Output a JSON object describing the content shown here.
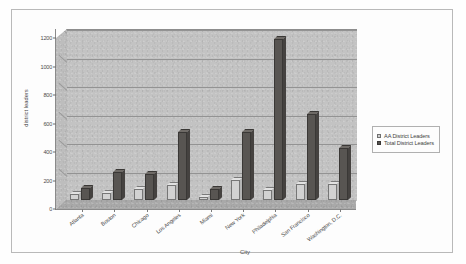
{
  "chart_data": {
    "type": "bar",
    "title": "",
    "xlabel": "City",
    "ylabel": "district leaders",
    "ylim": [
      0,
      1200
    ],
    "yticks": [
      0,
      200,
      400,
      600,
      800,
      1000,
      1200
    ],
    "grid": true,
    "legend_position": "right",
    "categories": [
      "Atlanta",
      "Boston",
      "Chicago",
      "Los Angeles",
      "Miami",
      "New York",
      "Philadelphia",
      "San Francisco",
      "Washington, D.C."
    ],
    "series": [
      {
        "name": "AA District Leaders",
        "color": "#d2d2d2",
        "values": [
          45,
          50,
          80,
          105,
          20,
          140,
          70,
          115,
          115
        ]
      },
      {
        "name": "Total District Leaders",
        "color": "#585552",
        "values": [
          85,
          195,
          180,
          480,
          75,
          480,
          1130,
          605,
          365
        ]
      }
    ]
  },
  "legend": {
    "items": [
      {
        "label": "AA District Leaders"
      },
      {
        "label": "Total District Leaders"
      }
    ]
  }
}
